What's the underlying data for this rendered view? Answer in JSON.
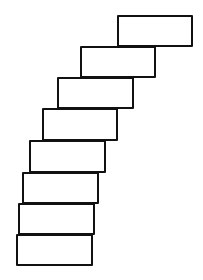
{
  "diagram": {
    "stroke_color": "#111111",
    "fill_color": "#ffffff",
    "background": "#ffffff",
    "blocks": [
      {
        "index": 1,
        "left": 117,
        "top": 15,
        "width": 76,
        "height": 32
      },
      {
        "index": 2,
        "left": 80,
        "top": 46,
        "width": 76,
        "height": 32
      },
      {
        "index": 3,
        "left": 57,
        "top": 77,
        "width": 77,
        "height": 32
      },
      {
        "index": 4,
        "left": 42,
        "top": 108,
        "width": 76,
        "height": 33
      },
      {
        "index": 5,
        "left": 29,
        "top": 140,
        "width": 77,
        "height": 33
      },
      {
        "index": 6,
        "left": 22,
        "top": 172,
        "width": 77,
        "height": 32
      },
      {
        "index": 7,
        "left": 18,
        "top": 203,
        "width": 77,
        "height": 32
      },
      {
        "index": 8,
        "left": 16,
        "top": 234,
        "width": 77,
        "height": 32
      }
    ]
  }
}
